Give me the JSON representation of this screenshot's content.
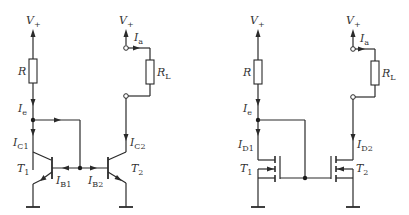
{
  "diagram": {
    "colors": {
      "line": "#2a2a2a",
      "background": "#ffffff"
    },
    "bjt_mirror": {
      "supply_ref": {
        "main": "V",
        "sub": "+"
      },
      "supply_out": {
        "main": "V",
        "sub": "+"
      },
      "resistor": {
        "main": "R",
        "sub": ""
      },
      "load": {
        "main": "R",
        "sub": "L"
      },
      "i_out": {
        "main": "I",
        "sub": "a"
      },
      "i_ref": {
        "main": "I",
        "sub": "e"
      },
      "i_c1": {
        "main": "I",
        "sub": "C1"
      },
      "i_c2": {
        "main": "I",
        "sub": "C2"
      },
      "i_b1": {
        "main": "I",
        "sub": "B1"
      },
      "i_b2": {
        "main": "I",
        "sub": "B2"
      },
      "t1": {
        "main": "T",
        "sub": "1"
      },
      "t2": {
        "main": "T",
        "sub": "2"
      }
    },
    "mos_mirror": {
      "supply_ref": {
        "main": "V",
        "sub": "+"
      },
      "supply_out": {
        "main": "V",
        "sub": "+"
      },
      "resistor": {
        "main": "R",
        "sub": ""
      },
      "load": {
        "main": "R",
        "sub": "L"
      },
      "i_out": {
        "main": "I",
        "sub": "a"
      },
      "i_ref": {
        "main": "I",
        "sub": "e"
      },
      "i_d1": {
        "main": "I",
        "sub": "D1"
      },
      "i_d2": {
        "main": "I",
        "sub": "D2"
      },
      "t1": {
        "main": "T",
        "sub": "1"
      },
      "t2": {
        "main": "T",
        "sub": "2"
      }
    }
  }
}
